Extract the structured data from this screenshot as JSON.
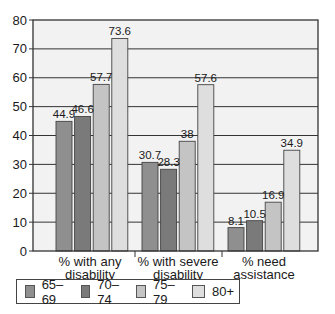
{
  "chart_data": {
    "type": "bar",
    "title": "",
    "xlabel": "",
    "ylabel": "",
    "ylim": [
      0,
      80
    ],
    "yticks": [
      0,
      10,
      20,
      30,
      40,
      50,
      60,
      70,
      80
    ],
    "grid": true,
    "legend_position": "bottom",
    "categories": [
      "% with any disability",
      "% with severe disability",
      "% need assistance"
    ],
    "category_lines": [
      [
        "% with any",
        "disability"
      ],
      [
        "% with severe",
        "disability"
      ],
      [
        "% need",
        "assistance"
      ]
    ],
    "series": [
      {
        "name": "65–69",
        "color": "#8f8f8f",
        "values": [
          44.9,
          30.7,
          8.1
        ],
        "labels": [
          "44.9",
          "30.7",
          "8.1"
        ]
      },
      {
        "name": "70–74",
        "color": "#7a7a7a",
        "values": [
          46.6,
          28.3,
          10.5
        ],
        "labels": [
          "46.6",
          "28.3",
          "10.5"
        ]
      },
      {
        "name": "75–79",
        "color": "#c4c4c4",
        "values": [
          57.7,
          38,
          16.9
        ],
        "labels": [
          "57.7",
          "38",
          "16.9"
        ]
      },
      {
        "name": "80+",
        "color": "#dedede",
        "values": [
          73.6,
          57.6,
          34.9
        ],
        "labels": [
          "73.6",
          "57.6",
          "34.9"
        ]
      }
    ]
  },
  "colors": {
    "plot_background": "#f2f2f2",
    "gridline": "#333333",
    "axis": "#333333"
  }
}
